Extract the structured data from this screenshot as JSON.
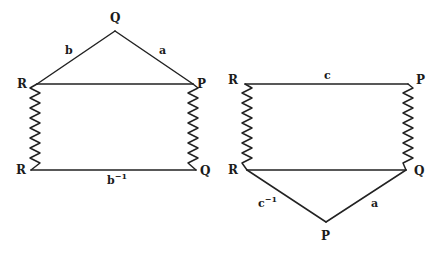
{
  "figures": {
    "left": {
      "vertices": {
        "apex": {
          "label": "Q",
          "x": 115,
          "y": 31
        },
        "top_left": {
          "label": "R",
          "x": 37,
          "y": 84
        },
        "top_right": {
          "label": "P",
          "x": 193,
          "y": 84
        },
        "bottom_left": {
          "label": "R",
          "x": 31,
          "y": 170
        },
        "bottom_right": {
          "label": "Q",
          "x": 196,
          "y": 170
        }
      },
      "edges": {
        "left_slant": {
          "label": "b",
          "from": "R",
          "to": "Q"
        },
        "right_slant": {
          "label": "a",
          "from": "Q",
          "to": "P"
        },
        "top": {
          "label": "",
          "from": "R",
          "to": "P"
        },
        "bottom": {
          "label": "b",
          "superscript": "−1",
          "from": "R",
          "to": "Q"
        },
        "left_zigzag": {
          "from": "R",
          "to": "R",
          "style": "zigzag"
        },
        "right_zigzag": {
          "from": "P",
          "to": "Q",
          "style": "zigzag"
        }
      }
    },
    "right": {
      "vertices": {
        "top_left": {
          "label": "R",
          "x": 245,
          "y": 84
        },
        "top_right": {
          "label": "P",
          "x": 408,
          "y": 84
        },
        "bottom_left": {
          "label": "R",
          "x": 247,
          "y": 170
        },
        "bottom_right": {
          "label": "Q",
          "x": 406,
          "y": 170
        },
        "apex": {
          "label": "P",
          "x": 326,
          "y": 222
        }
      },
      "edges": {
        "top": {
          "label": "c",
          "from": "R",
          "to": "P"
        },
        "middle": {
          "label": "",
          "from": "R",
          "to": "Q"
        },
        "left_slant": {
          "label": "c",
          "superscript": "−1",
          "from": "R",
          "to": "P"
        },
        "right_slant": {
          "label": "a",
          "from": "P",
          "to": "Q"
        },
        "left_zigzag": {
          "from": "R",
          "to": "R",
          "style": "zigzag"
        },
        "right_zigzag": {
          "from": "P",
          "to": "Q",
          "style": "zigzag"
        }
      }
    }
  },
  "colors": {
    "stroke": "#222222",
    "background": "#ffffff"
  }
}
